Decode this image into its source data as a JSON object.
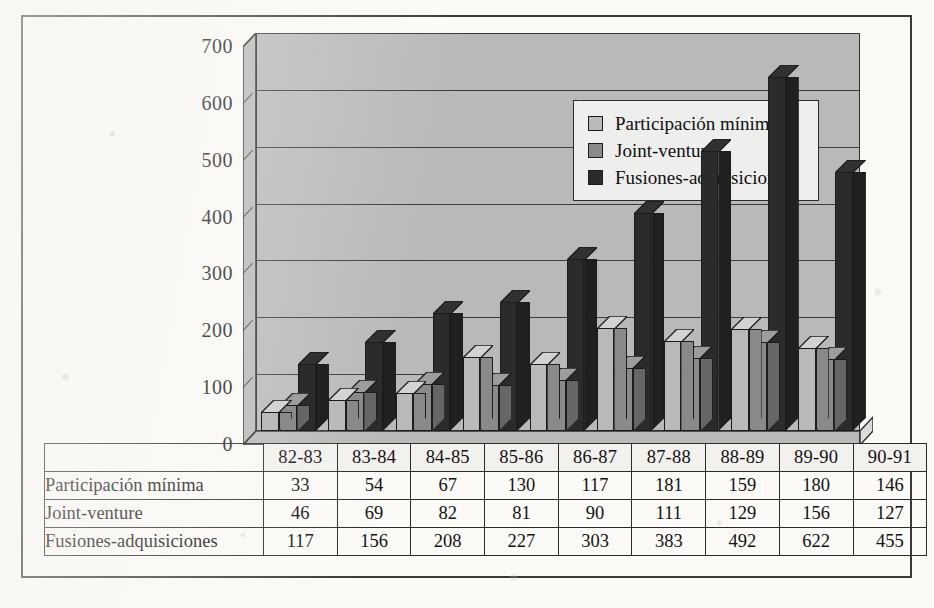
{
  "chart_data": {
    "type": "bar",
    "title": "",
    "subtitle": "",
    "xlabel": "",
    "ylabel": "",
    "grid": true,
    "legend_position": "top-center-inside",
    "style": "3d-clustered-column",
    "ylim": [
      0,
      700
    ],
    "yticks": [
      0,
      100,
      200,
      300,
      400,
      500,
      600,
      700
    ],
    "categories": [
      "82-83",
      "83-84",
      "84-85",
      "85-86",
      "86-87",
      "87-88",
      "88-89",
      "89-90",
      "90-91"
    ],
    "series": [
      {
        "name": "Participación mínima",
        "color": "#b9b9b9",
        "values": [
          33,
          54,
          67,
          130,
          117,
          181,
          159,
          180,
          146
        ]
      },
      {
        "name": "Joint-venture",
        "color": "#8a8a8a",
        "values": [
          46,
          69,
          82,
          81,
          90,
          111,
          129,
          156,
          127
        ]
      },
      {
        "name": "Fusiones-adquisiciones",
        "color": "#2b2b2b",
        "values": [
          117,
          156,
          208,
          227,
          303,
          383,
          492,
          622,
          455
        ]
      }
    ]
  },
  "legend": {
    "items": [
      {
        "label": "Participación mínima",
        "color": "#b9b9b9"
      },
      {
        "label": "Joint-venture",
        "color": "#8a8a8a"
      },
      {
        "label": "Fusiones-adquisiciones",
        "color": "#2b2b2b"
      }
    ]
  },
  "table": {
    "corner_label": "",
    "column_headers": [
      "82-83",
      "83-84",
      "84-85",
      "85-86",
      "86-87",
      "87-88",
      "88-89",
      "89-90",
      "90-91"
    ],
    "rows": [
      {
        "label": "Participación mínima",
        "values": [
          "33",
          "54",
          "67",
          "130",
          "117",
          "181",
          "159",
          "180",
          "146"
        ]
      },
      {
        "label": "Joint-venture",
        "values": [
          "46",
          "69",
          "82",
          "81",
          "90",
          "111",
          "129",
          "156",
          "127"
        ]
      },
      {
        "label": "Fusiones-adquisiciones",
        "values": [
          "117",
          "156",
          "208",
          "227",
          "303",
          "383",
          "492",
          "622",
          "455"
        ]
      }
    ]
  },
  "colors": {
    "plot_background": "#b9b9b9",
    "series_light": "#b9b9b9",
    "series_medium": "#8a8a8a",
    "series_dark": "#2b2b2b",
    "frame": "#3a3a3a",
    "page": "#fbfaf7"
  }
}
